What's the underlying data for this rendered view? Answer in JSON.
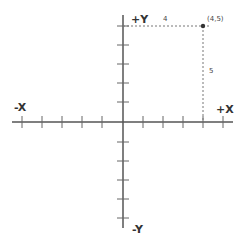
{
  "diagram": {
    "type": "coordinate-plane",
    "axes": {
      "x_positive_label": "+X",
      "x_negative_label": "-X",
      "y_positive_label": "+Y",
      "y_negative_label": "-Y",
      "ticks_per_half_axis": 5
    },
    "point": {
      "label": "(4,5)",
      "x": 4,
      "y": 5
    },
    "guides": {
      "horizontal_distance_label": "4",
      "vertical_distance_label": "5"
    },
    "colors": {
      "axis": "#555555",
      "guide": "#777777",
      "point": "#333333",
      "text": "#333333"
    }
  }
}
